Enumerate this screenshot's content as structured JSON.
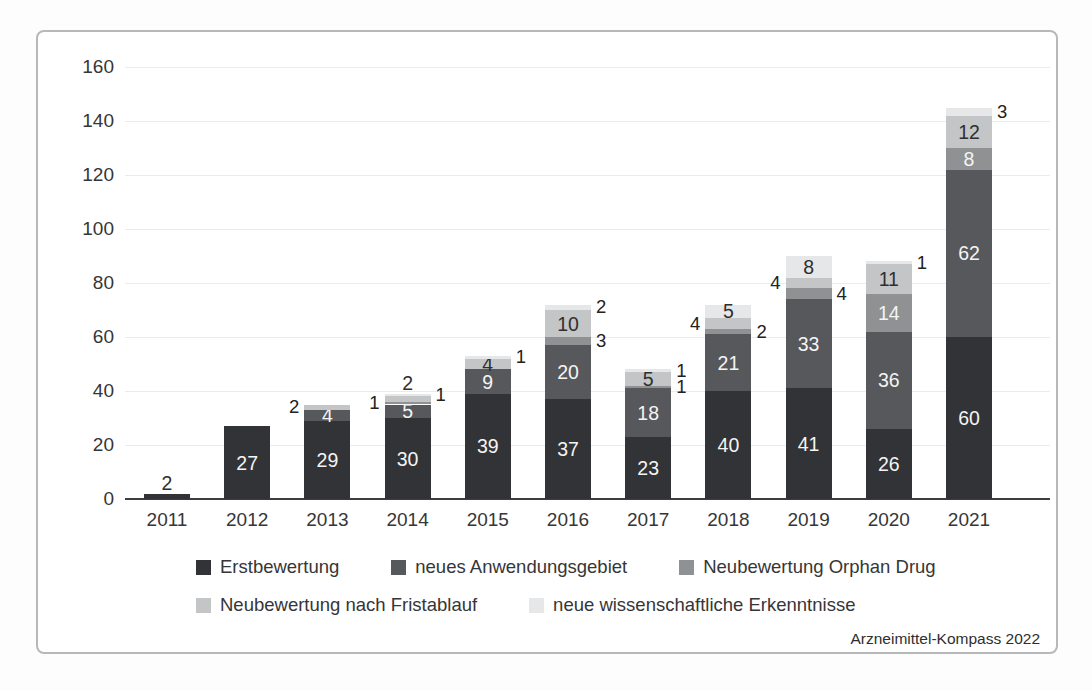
{
  "source_credit": "Arzneimittel-Kompass 2022",
  "colors": {
    "axis": "#3d3e40",
    "grid": "#ebebeb",
    "text": "#363636",
    "panel_border": "#b6b8ba",
    "label_on_dark": "#f4f4f4",
    "label_on_light": "#2f2f2f"
  },
  "chart_data": {
    "type": "bar",
    "stacked": true,
    "title": "",
    "xlabel": "",
    "ylabel": "",
    "grid": true,
    "legend_position": "bottom",
    "ylim": [
      0,
      160
    ],
    "yticks": [
      0,
      20,
      40,
      60,
      80,
      100,
      120,
      140,
      160
    ],
    "categories": [
      "2011",
      "2012",
      "2013",
      "2014",
      "2015",
      "2016",
      "2017",
      "2018",
      "2019",
      "2020",
      "2021"
    ],
    "series": [
      {
        "name": "Erstbewertung",
        "color": "#323336",
        "values": [
          2,
          27,
          29,
          30,
          39,
          37,
          23,
          40,
          41,
          26,
          60
        ]
      },
      {
        "name": "neues Anwendungsgebiet",
        "color": "#57585b",
        "values": [
          0,
          0,
          4,
          5,
          9,
          20,
          18,
          21,
          33,
          36,
          62
        ]
      },
      {
        "name": "Neubewertung Orphan Drug",
        "color": "#8f9193",
        "values": [
          0,
          0,
          0,
          1,
          0,
          3,
          1,
          2,
          4,
          14,
          8
        ]
      },
      {
        "name": "Neubewertung nach Fristablauf",
        "color": "#c3c5c7",
        "values": [
          0,
          0,
          2,
          2,
          4,
          10,
          5,
          4,
          4,
          11,
          12
        ]
      },
      {
        "name": "neue wissenschaftliche Erkenntnisse",
        "color": "#e6e7e8",
        "values": [
          0,
          0,
          0,
          1,
          1,
          2,
          1,
          5,
          8,
          1,
          3
        ]
      }
    ],
    "totals": [
      2,
      27,
      35,
      39,
      53,
      72,
      48,
      72,
      90,
      88,
      145
    ],
    "legend_rows": [
      [
        0,
        1,
        2
      ],
      [
        3,
        4
      ]
    ],
    "label_placement": [
      [
        "above",
        null,
        null,
        null,
        null
      ],
      [
        "in",
        null,
        null,
        null,
        null
      ],
      [
        "in",
        "in",
        null,
        "left",
        null
      ],
      [
        "in",
        "in",
        "left",
        "above",
        "right"
      ],
      [
        "in",
        "in",
        null,
        "in",
        "right"
      ],
      [
        "in",
        "in",
        "right",
        "in",
        "right"
      ],
      [
        "in",
        "in",
        "right",
        "in",
        "right"
      ],
      [
        "in",
        "in",
        "right",
        "left",
        "in"
      ],
      [
        "in",
        "in",
        "right",
        "left",
        "in"
      ],
      [
        "in",
        "in",
        "in",
        "in",
        "right"
      ],
      [
        "in",
        "in",
        "in",
        "in",
        "right"
      ]
    ],
    "source": "Arzneimittel-Kompass 2022"
  }
}
